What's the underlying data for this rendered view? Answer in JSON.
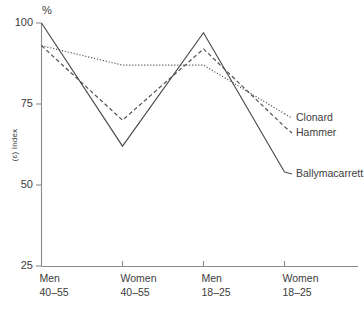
{
  "chart_data": {
    "type": "line",
    "title": "",
    "xlabel": "",
    "ylabel": "(ɛ) Index",
    "unit_label": "%",
    "categories": [
      "Men 40–55",
      "Women 40–55",
      "Men 18–25",
      "Women 18–25"
    ],
    "category_lines": [
      [
        "Men",
        "40–55"
      ],
      [
        "Women",
        "40–55"
      ],
      [
        "Men",
        "18–25"
      ],
      [
        "Women",
        "18–25"
      ]
    ],
    "ylim": [
      25,
      100
    ],
    "yticks": [
      25,
      50,
      75,
      100
    ],
    "ytick_labels": [
      "25",
      "50",
      "75",
      "100"
    ],
    "grid": false,
    "legend_position": "right-inline",
    "series": [
      {
        "name": "Ballymacarrett",
        "style": "solid",
        "values": [
          100,
          62,
          97,
          54
        ]
      },
      {
        "name": "Hammer",
        "style": "dashed",
        "values": [
          93,
          70,
          92,
          68
        ]
      },
      {
        "name": "Clonard",
        "style": "dotted",
        "values": [
          93,
          87,
          87,
          72
        ]
      }
    ],
    "legend_entries": [
      {
        "label": "Clonard",
        "style": "dotted"
      },
      {
        "label": "Hammer",
        "style": "dashed"
      },
      {
        "label": "Ballymacarrett",
        "style": "solid"
      }
    ],
    "colors": {
      "line": "#4a4a4a",
      "axis": "#8a8a8a",
      "text": "#3c3c3c",
      "background": "#ffffff"
    }
  }
}
